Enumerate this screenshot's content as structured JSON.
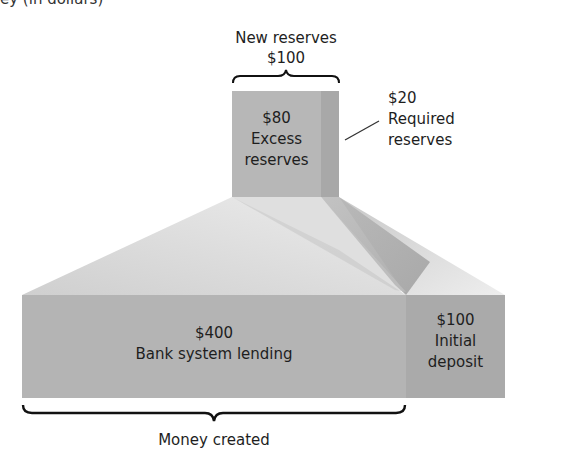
{
  "header": {
    "cut_off_title": "ey (in dollars)"
  },
  "top": {
    "brace_label_line1": "New reserves",
    "brace_label_line2": "$100",
    "excess": {
      "amount": "$80",
      "label_line1": "Excess",
      "label_line2": "reserves"
    },
    "required": {
      "amount": "$20",
      "label_line1": "Required",
      "label_line2": "reserves"
    }
  },
  "bottom": {
    "lending": {
      "amount": "$400",
      "label": "Bank system lending"
    },
    "deposit": {
      "amount": "$100",
      "label_line1": "Initial",
      "label_line2": "deposit"
    },
    "brace_label": "Money created"
  },
  "colors": {
    "box_fill": "#b5b5b5",
    "required_strip": "#a9a9a9",
    "fan_light": "#e6e6e6",
    "fan_dark": "#b0b0b0",
    "brace": "#111111",
    "text": "#1e1e1e"
  }
}
